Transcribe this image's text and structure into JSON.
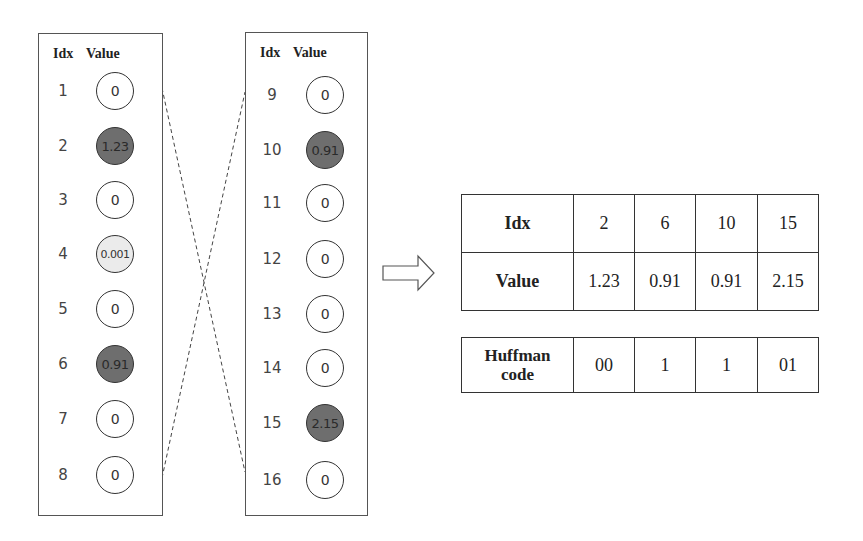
{
  "left_panel": {
    "header_idx": "Idx",
    "header_value": "Value",
    "rows": [
      {
        "idx": "1",
        "value": "0",
        "shade": "none"
      },
      {
        "idx": "2",
        "value": "1.23",
        "shade": "dark"
      },
      {
        "idx": "3",
        "value": "0",
        "shade": "none"
      },
      {
        "idx": "4",
        "value": "0.001",
        "shade": "light"
      },
      {
        "idx": "5",
        "value": "0",
        "shade": "none"
      },
      {
        "idx": "6",
        "value": "0.91",
        "shade": "dark"
      },
      {
        "idx": "7",
        "value": "0",
        "shade": "none"
      },
      {
        "idx": "8",
        "value": "0",
        "shade": "none"
      }
    ]
  },
  "right_panel": {
    "header_idx": "Idx",
    "header_value": "Value",
    "rows": [
      {
        "idx": "9",
        "value": "0",
        "shade": "none"
      },
      {
        "idx": "10",
        "value": "0.91",
        "shade": "dark"
      },
      {
        "idx": "11",
        "value": "0",
        "shade": "none"
      },
      {
        "idx": "12",
        "value": "0",
        "shade": "none"
      },
      {
        "idx": "13",
        "value": "0",
        "shade": "none"
      },
      {
        "idx": "14",
        "value": "0",
        "shade": "none"
      },
      {
        "idx": "15",
        "value": "2.15",
        "shade": "dark"
      },
      {
        "idx": "16",
        "value": "0",
        "shade": "none"
      }
    ]
  },
  "arrow_icon": "right-arrow-outline",
  "sparse_table": {
    "rows": [
      {
        "label": "Idx",
        "cells": [
          "2",
          "6",
          "10",
          "15"
        ]
      },
      {
        "label": "Value",
        "cells": [
          "1.23",
          "0.91",
          "0.91",
          "2.15"
        ]
      }
    ]
  },
  "huffman_table": {
    "label_line1": "Huffman",
    "label_line2": "code",
    "cells": [
      "00",
      "1",
      "1",
      "01"
    ]
  },
  "colors": {
    "dark_fill": "#6e6e6e",
    "light_fill": "#ebebeb",
    "border": "#333333"
  }
}
